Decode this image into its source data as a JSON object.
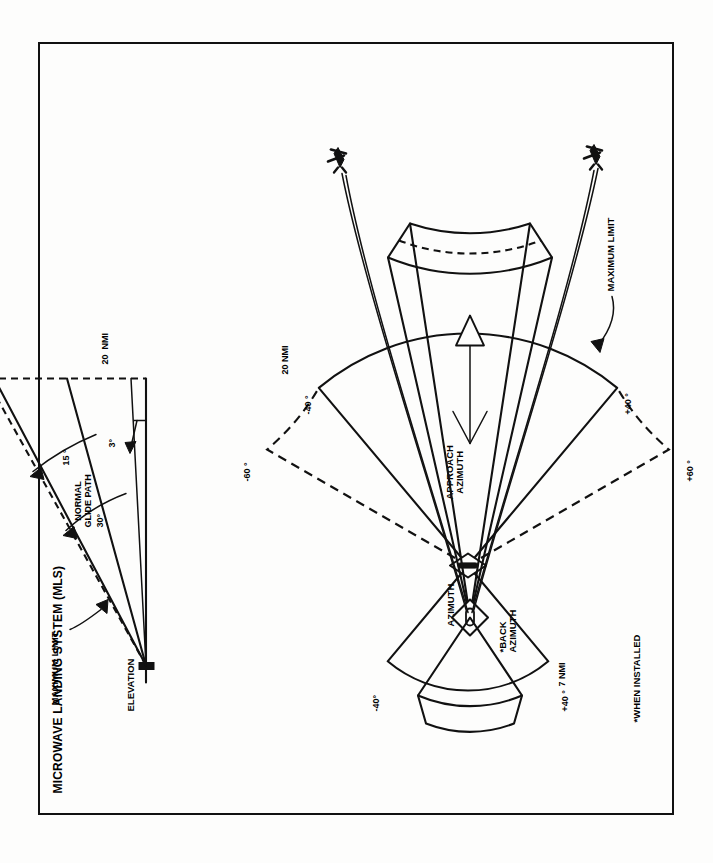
{
  "figure": {
    "title": "MICROWAVE LANDING SYSTEM (MLS)",
    "orientation_note": "plate printed rotated 90 degrees"
  },
  "azimuth_diagram": {
    "name": "azimuth-coverage-plan-view",
    "section_label": "AZIMUTH",
    "approach_label": "APPROACH\nAZIMUTH",
    "back_label": "*BACK\nAZIMUTH",
    "approach_range": "20 NMI",
    "back_range": "7 NMI",
    "maximum_limit": "MAXIMUM LIMIT",
    "footnote": "*WHEN INSTALLED",
    "approach_minus": "-40 °",
    "approach_plus": "+40 °",
    "limit_minus": "-60 °",
    "limit_plus": "+60 °",
    "back_minus": "-40°",
    "back_plus": "+40 °"
  },
  "elevation_diagram": {
    "name": "elevation-coverage-profile-view",
    "section_label": "ELEVATION",
    "range": "20  NMI",
    "glide_path": "NORMAL\nGLIDE PATH",
    "glide_angle": "3°",
    "proportional_limit": "15 °",
    "maximum_angle": "30°",
    "altitude": "20,000 '",
    "maximum_limit": "MAXIMUM LIMIT"
  },
  "perspective_diagram": {
    "name": "mls-coverage-volume-perspective",
    "elements": [
      "approach-coverage-wedge",
      "back-azimuth-wedge",
      "runway-symbol",
      "aircraft-upper",
      "aircraft-lower",
      "centerline-arrow"
    ]
  }
}
